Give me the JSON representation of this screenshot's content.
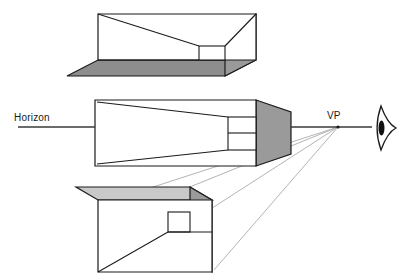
{
  "diagram": {
    "type": "perspective-construction",
    "labels": {
      "horizon": "Horizon",
      "vanishing_point": "VP"
    },
    "colors": {
      "background": "#ffffff",
      "stroke": "#1a1a1a",
      "face_side_gray": "#9a9a9a",
      "face_bottom_gray": "#8d8d8d",
      "face_top_gray": "#c9c9c9",
      "face_white": "#ffffff",
      "guide_line": "#b4b4b4",
      "horizon_line": "#3a3a3a",
      "text": "#1a1a1a"
    },
    "vanishing_point": {
      "x": 338,
      "y": 127
    },
    "horizon_line": {
      "y": 127,
      "x_start": 18,
      "x_end": 372
    },
    "geometry": {
      "box_above": {
        "name": "box-above-horizon",
        "position": "above horizon (viewed from below-ish / bottom face visible)",
        "front_face": [
          [
            98,
            14
          ],
          [
            256,
            14
          ],
          [
            256,
            60
          ],
          [
            98,
            60
          ]
        ],
        "visible_faces": [
          "front-white",
          "right-gray",
          "bottom-gray",
          "interior-top"
        ]
      },
      "box_at": {
        "name": "box-at-horizon",
        "position": "on horizon (eye level, interior visible)",
        "front_face": [
          [
            95,
            100
          ],
          [
            256,
            100
          ],
          [
            256,
            166
          ],
          [
            95,
            166
          ]
        ],
        "visible_faces": [
          "front-white",
          "right-gray",
          "interior-back"
        ]
      },
      "box_below": {
        "name": "box-below-horizon",
        "position": "below horizon (top face visible)",
        "front_face": [
          [
            98,
            200
          ],
          [
            212,
            200
          ],
          [
            212,
            272
          ],
          [
            98,
            272
          ]
        ],
        "visible_faces": [
          "front-white",
          "right-gray",
          "top-lightgray"
        ]
      }
    },
    "guide_lines": {
      "count": 4,
      "from": "vanishing-point",
      "to": "box-below-horizon corners"
    },
    "eye_symbol": {
      "name": "eye-icon",
      "x": 381,
      "y": 128,
      "description": "pointed oval eye with pupil at right end of horizon"
    }
  }
}
